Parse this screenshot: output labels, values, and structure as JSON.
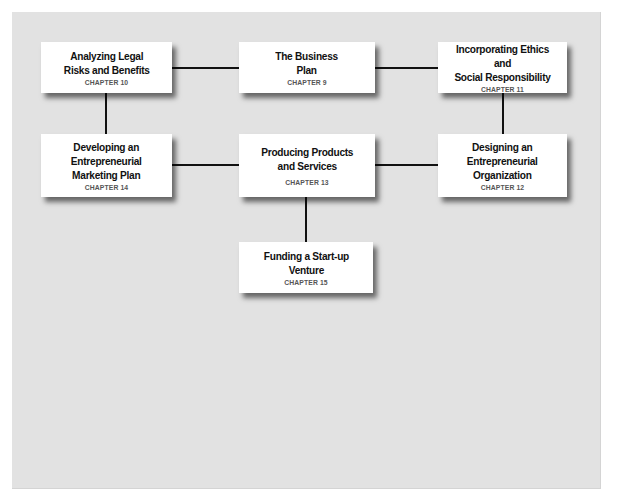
{
  "diagram": {
    "nodes": [
      {
        "id": "n10",
        "title": "Analyzing Legal\nRisks and Benefits",
        "chapter": "CHAPTER 10"
      },
      {
        "id": "n9",
        "title": "The Business\nPlan",
        "chapter": "CHAPTER 9"
      },
      {
        "id": "n11",
        "title": "Incorporating Ethics and\nSocial Responsibility",
        "chapter": "CHAPTER 11"
      },
      {
        "id": "n14",
        "title": "Developing an\nEntrepreneurial\nMarketing Plan",
        "chapter": "CHAPTER 14"
      },
      {
        "id": "n13",
        "title": "Producing Products\nand Services",
        "chapter": "CHAPTER 13"
      },
      {
        "id": "n12",
        "title": "Designing an\nEntrepreneurial\nOrganization",
        "chapter": "CHAPTER 12"
      },
      {
        "id": "n15",
        "title": "Funding a Start-up\nVenture",
        "chapter": "CHAPTER 15"
      }
    ],
    "edges": [
      [
        "n10",
        "n9"
      ],
      [
        "n9",
        "n11"
      ],
      [
        "n10",
        "n14"
      ],
      [
        "n11",
        "n12"
      ],
      [
        "n14",
        "n13"
      ],
      [
        "n13",
        "n12"
      ],
      [
        "n13",
        "n15"
      ]
    ],
    "colors": {
      "background": "#e2e2e2",
      "box": "#ffffff",
      "line": "#111111",
      "chapter_text": "#555555"
    }
  }
}
